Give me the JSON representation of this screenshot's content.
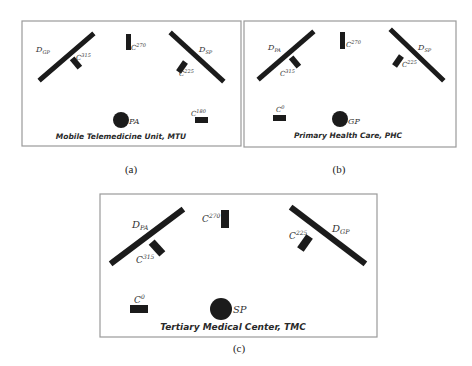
{
  "figure": {
    "panels": [
      {
        "id": "a",
        "sub_caption": "(a)",
        "title": "Mobile Telemedicine Unit, MTU",
        "left_display": {
          "name": "D",
          "sub": "GP"
        },
        "right_display": {
          "name": "D",
          "sub": "SP"
        },
        "patient": "PA",
        "cameras": [
          {
            "name": "C",
            "angle": "315"
          },
          {
            "name": "C",
            "angle": "270"
          },
          {
            "name": "C",
            "angle": "225"
          },
          {
            "name": "C",
            "angle": "180"
          }
        ]
      },
      {
        "id": "b",
        "sub_caption": "(b)",
        "title": "Primary Health Care, PHC",
        "left_display": {
          "name": "D",
          "sub": "PA"
        },
        "right_display": {
          "name": "D",
          "sub": "SP"
        },
        "patient": "GP",
        "cameras": [
          {
            "name": "C",
            "angle": "315"
          },
          {
            "name": "C",
            "angle": "270"
          },
          {
            "name": "C",
            "angle": "225"
          },
          {
            "name": "C",
            "angle": "0"
          }
        ]
      },
      {
        "id": "c",
        "sub_caption": "(c)",
        "title": "Tertiary Medical Center, TMC",
        "left_display": {
          "name": "D",
          "sub": "PA"
        },
        "right_display": {
          "name": "D",
          "sub": "GP"
        },
        "patient": "SP",
        "cameras": [
          {
            "name": "C",
            "angle": "315"
          },
          {
            "name": "C",
            "angle": "270"
          },
          {
            "name": "C",
            "angle": "225"
          },
          {
            "name": "C",
            "angle": "0"
          }
        ]
      }
    ],
    "colors": {
      "ink": "#1b1b1b",
      "frame": "#9a9a9a",
      "background": "#ffffff"
    }
  }
}
